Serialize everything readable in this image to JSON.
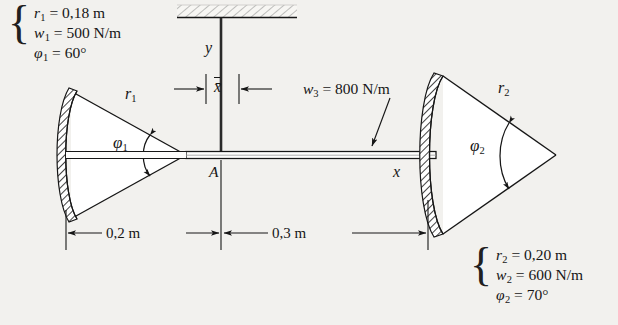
{
  "figure": {
    "background_color": "#f2f1ee",
    "line_color": "#161616"
  },
  "left_spec": {
    "lines": [
      {
        "sym": "r",
        "sub": "1",
        "eq": "=",
        "value": "0,18",
        "unit": "m"
      },
      {
        "sym": "w",
        "sub": "1",
        "eq": "=",
        "value": "500",
        "unit": "N/m"
      },
      {
        "sym": "φ",
        "sub": "1",
        "eq": "=",
        "value": "60",
        "unit": "°"
      }
    ],
    "line1": "r₁ = 0,18 m",
    "line2": "w₁ = 500 N/m",
    "line3": "φ₁ = 60°",
    "brace": "{"
  },
  "right_spec": {
    "lines": [
      {
        "sym": "r",
        "sub": "2",
        "eq": "=",
        "value": "0,20",
        "unit": "m"
      },
      {
        "sym": "w",
        "sub": "2",
        "eq": "=",
        "value": "600",
        "unit": "N/m"
      },
      {
        "sym": "φ",
        "sub": "2",
        "eq": "=",
        "value": "70",
        "unit": "°"
      }
    ],
    "line1": "r₂ = 0,20 m",
    "line2": "w₂ = 600 N/m",
    "line3": "φ₂ = 70°",
    "brace": "{"
  },
  "callouts": {
    "w3_sym": "w",
    "w3_sub": "3",
    "w3_eq": "=",
    "w3_value": "800",
    "w3_unit": "N/m",
    "w3_full": "w₃ = 800 N/m"
  },
  "axes": {
    "y_label": "y",
    "x_label": "x",
    "origin_label": "A",
    "centroid_label": "x̄"
  },
  "radii": {
    "r1_sym": "r",
    "r1_sub": "1",
    "r2_sym": "r",
    "r2_sub": "2"
  },
  "angles": {
    "phi1_sym": "φ",
    "phi1_sub": "1",
    "phi2_sym": "φ",
    "phi2_sub": "2"
  },
  "dimensions": [
    {
      "name": "left-span",
      "label": "0,2 m"
    },
    {
      "name": "right-span",
      "label": "0,3 m"
    }
  ],
  "dimension_left": "0,2 m",
  "dimension_right": "0,3 m"
}
